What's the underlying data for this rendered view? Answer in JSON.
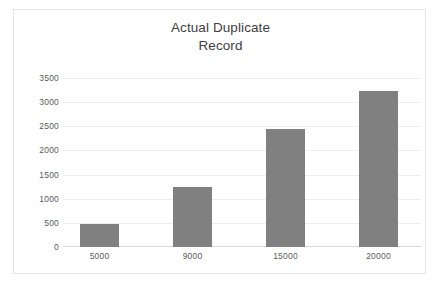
{
  "chart_data": {
    "type": "bar",
    "title": "Actual Duplicate\nRecord",
    "title_line1": "Actual Duplicate",
    "title_line2": "Record",
    "categories": [
      "5000",
      "9000",
      "15000",
      "20000"
    ],
    "values": [
      470,
      1250,
      2450,
      3250
    ],
    "series": [
      {
        "name": "Actual Duplicate Record",
        "values": [
          470,
          1250,
          2450,
          3250
        ]
      }
    ],
    "xlabel": "",
    "ylabel": "",
    "ylim": [
      0,
      3500
    ],
    "y_ticks": [
      "0",
      "500",
      "1000",
      "1500",
      "2000",
      "2500",
      "3000",
      "3500"
    ],
    "y_tick_values": [
      0,
      500,
      1000,
      1500,
      2000,
      2500,
      3000,
      3500
    ],
    "y_tick_interval": 500,
    "grid": "horizontal",
    "legend": "none",
    "bar_color": "#808080",
    "gridline_color": "#eceded",
    "axis_line_color": "#d8dadb",
    "title_color": "#404040",
    "tick_label_color": "#5a5a5a",
    "plot_background": "#ffffff",
    "frame_border_color": "#e4e6e8"
  }
}
